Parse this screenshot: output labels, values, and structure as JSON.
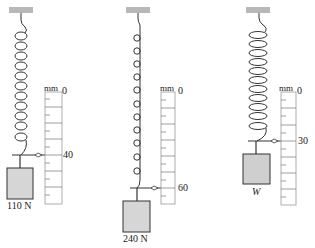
{
  "diagram": {
    "type": "spring-scale-comparison",
    "colors": {
      "ceiling": "#b8b8b8",
      "block": "#d6d6d6",
      "line": "#333333",
      "scale_border": "#999999"
    },
    "panels": [
      {
        "id": "panel-1",
        "spring_style": "wide-coil",
        "coil_count": 11,
        "scale": {
          "unit": "mm",
          "zero_label": "0",
          "pointer_label": "40",
          "pointer_value": 40
        },
        "weight_label": "110 N"
      },
      {
        "id": "panel-2",
        "spring_style": "small-loop",
        "coil_count": 11,
        "scale": {
          "unit": "mm",
          "zero_label": "0",
          "pointer_label": "60",
          "pointer_value": 60
        },
        "weight_label": "240 N"
      },
      {
        "id": "panel-3",
        "spring_style": "wide-coil",
        "coil_count": 11,
        "scale": {
          "unit": "mm",
          "zero_label": "0",
          "pointer_label": "30",
          "pointer_value": 30
        },
        "weight_label": "W"
      }
    ]
  }
}
